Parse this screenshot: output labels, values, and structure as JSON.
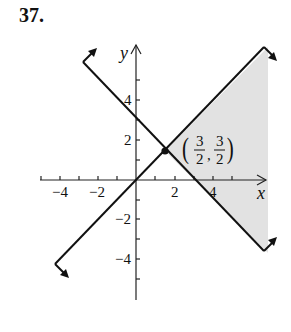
{
  "problem_number": "37.",
  "graph": {
    "axis_labels": {
      "x": "x",
      "y": "y"
    },
    "x_tick_labels": [
      "−4",
      "−2",
      "2",
      "4"
    ],
    "y_tick_labels": [
      "4",
      "2",
      "−2",
      "−4"
    ],
    "lines": [
      {
        "name": "y = x",
        "slope": 1,
        "intercept": 0
      },
      {
        "name": "y = -x + 3",
        "slope": -1,
        "intercept": 3
      }
    ],
    "vertex_point": {
      "x": 1.5,
      "y": 1.5
    },
    "vertex_label": {
      "open": "(",
      "num1": "3",
      "den1": "2",
      "comma": ",",
      "num2": "3",
      "den2": "2",
      "close": ")"
    },
    "shaded_region": "between y = x and y = -x + 3, to the right of (3/2, 3/2)",
    "colors": {
      "line": "#111111",
      "shade": "#e2e2e2"
    }
  }
}
